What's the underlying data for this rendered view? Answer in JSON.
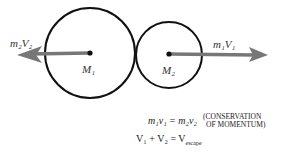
{
  "diagram": {
    "bodies": [
      {
        "label": "M₁",
        "arrow_label": "m₂V₂",
        "direction": "left"
      },
      {
        "label": "M₂",
        "arrow_label": "m₁V₁",
        "direction": "right"
      }
    ],
    "equations": {
      "momentum": "m₁v₁ = m₂v₂",
      "momentum_note_line1": "(CONSERVATION",
      "momentum_note_line2": "OF MOMENTUM)",
      "escape": "V₁ + V₂ = V",
      "escape_subscript": "escape"
    },
    "colors": {
      "circle": "#111111",
      "arrow": "#777777"
    }
  }
}
